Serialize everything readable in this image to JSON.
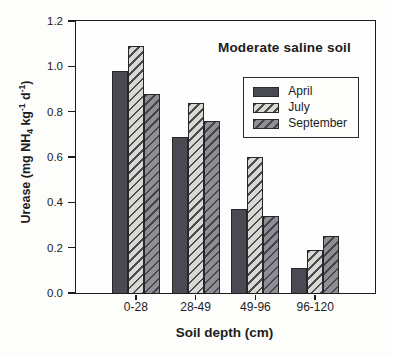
{
  "chart_data": {
    "type": "bar",
    "title": "Moderate saline soil",
    "xlabel": "Soil depth (cm)",
    "ylabel": "Urease (mg NH4 kg-1 d-1)",
    "ylabel_parts": [
      {
        "text": "Urease (mg NH"
      },
      {
        "text": "4",
        "style": "sub"
      },
      {
        "text": " kg"
      },
      {
        "text": "-1",
        "style": "sup"
      },
      {
        "text": " d"
      },
      {
        "text": "-1",
        "style": "sup"
      },
      {
        "text": ")"
      }
    ],
    "categories": [
      "0-28",
      "28-49",
      "49-96",
      "96-120"
    ],
    "series": [
      {
        "name": "April",
        "values": [
          0.98,
          0.69,
          0.37,
          0.11
        ],
        "fill": "#4a4a52",
        "hatched": false,
        "hatch_color": ""
      },
      {
        "name": "July",
        "values": [
          1.09,
          0.84,
          0.6,
          0.19
        ],
        "fill": "#d8d8d4",
        "hatched": true,
        "hatch_color": "#4b4b4b"
      },
      {
        "name": "September",
        "values": [
          0.88,
          0.76,
          0.34,
          0.25
        ],
        "fill": "#8e8e94",
        "hatched": true,
        "hatch_color": "#45454a"
      }
    ],
    "ylim": [
      0,
      1.2
    ],
    "ytick_labels": [
      "0.0",
      "0.2",
      "0.4",
      "0.6",
      "0.8",
      "1.0",
      "1.2"
    ],
    "grid": false,
    "legend_position": "upper-right-inside",
    "colors": {
      "axis": "#1c1c1c",
      "bar_outline": "#26262b",
      "background": "#fdfdfc"
    }
  }
}
